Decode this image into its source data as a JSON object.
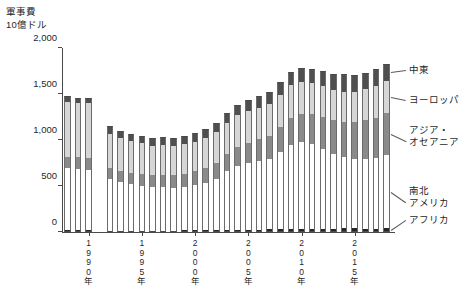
{
  "chart": {
    "title_line1": "軍事費",
    "title_line2": "10億ドル"
  },
  "chart_data": {
    "type": "bar",
    "subtype": "stacked",
    "title": "軍事費 10億ドル",
    "xlabel": "",
    "ylabel": "10億ドル",
    "ylim": [
      0,
      2000
    ],
    "ytick_values": [
      0,
      500,
      1000,
      1500,
      2000
    ],
    "ytick_labels": [
      "0",
      "500",
      "1,000",
      "1,500",
      "2,000"
    ],
    "grid": false,
    "legend_position": "right-callouts",
    "xtick_labels": [
      "1990年",
      "1995年",
      "2000年",
      "2005年",
      "2010年",
      "2015年"
    ],
    "xtick_years": [
      1990,
      1995,
      2000,
      2005,
      2010,
      2015
    ],
    "x": [
      1988,
      1989,
      1990,
      1992,
      1993,
      1994,
      1995,
      1996,
      1997,
      1998,
      1999,
      2000,
      2001,
      2002,
      2003,
      2004,
      2005,
      2006,
      2007,
      2008,
      2009,
      2010,
      2011,
      2012,
      2013,
      2014,
      2015,
      2016,
      2017,
      2018
    ],
    "series": [
      {
        "name": "アフリカ",
        "color": "#262626",
        "values": [
          18,
          18,
          18,
          16,
          15,
          15,
          15,
          15,
          16,
          16,
          17,
          18,
          19,
          20,
          21,
          23,
          25,
          27,
          29,
          32,
          34,
          35,
          34,
          36,
          38,
          41,
          39,
          37,
          38,
          39
        ]
      },
      {
        "name": "南北アメリカ",
        "color": "#ffffff",
        "values": [
          680,
          672,
          660,
          555,
          530,
          505,
          490,
          470,
          470,
          465,
          470,
          490,
          510,
          560,
          640,
          700,
          730,
          750,
          770,
          840,
          910,
          940,
          920,
          870,
          810,
          770,
          750,
          760,
          770,
          800
        ]
      },
      {
        "name": "アジア・オセアニア",
        "color": "#8a8a8a",
        "values": [
          120,
          122,
          122,
          120,
          120,
          120,
          125,
          130,
          135,
          138,
          145,
          155,
          165,
          175,
          185,
          200,
          215,
          230,
          245,
          265,
          295,
          310,
          325,
          345,
          365,
          385,
          405,
          420,
          435,
          455
        ]
      },
      {
        "name": "ヨーロッパ",
        "color": "#d6d6d6",
        "values": [
          600,
          590,
          600,
          380,
          360,
          345,
          335,
          325,
          325,
          320,
          320,
          320,
          325,
          330,
          340,
          345,
          345,
          345,
          345,
          350,
          355,
          350,
          340,
          335,
          330,
          325,
          330,
          340,
          345,
          350
        ]
      },
      {
        "name": "中東",
        "color": "#4f4f4f",
        "values": [
          62,
          60,
          62,
          78,
          78,
          80,
          82,
          82,
          85,
          86,
          88,
          92,
          98,
          100,
          105,
          112,
          120,
          125,
          130,
          140,
          148,
          152,
          158,
          168,
          180,
          192,
          185,
          175,
          180,
          188
        ]
      }
    ],
    "callouts": [
      {
        "label": "中東",
        "series": "中東"
      },
      {
        "label": "ヨーロッパ",
        "series": "ヨーロッパ"
      },
      {
        "label": "アジア・",
        "label2": "オセアニア",
        "series": "アジア・オセアニア"
      },
      {
        "label": "南北",
        "label2": "アメリカ",
        "series": "南北アメリカ"
      },
      {
        "label": "アフリカ",
        "series": "アフリカ"
      }
    ]
  },
  "callout_labels": {
    "middle_east": "中東",
    "europe": "ヨーロッパ",
    "asia_oceania_1": "アジア・",
    "asia_oceania_2": "オセアニア",
    "americas_1": "南北",
    "americas_2": "アメリカ",
    "africa": "アフリカ"
  }
}
